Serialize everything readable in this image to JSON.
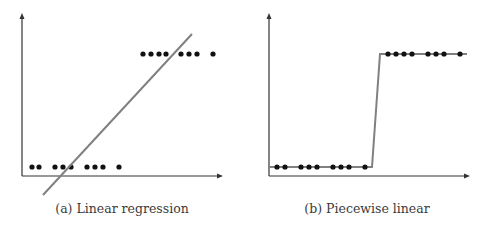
{
  "colors": {
    "axis": "#333333",
    "dot": "#111111",
    "fit_line": "#808080",
    "caption": "#3a3a3a"
  },
  "chart_data": [
    {
      "type": "scatter",
      "title": "(a) Linear regression",
      "caption": "(a) Linear regression",
      "xlabel": "",
      "ylabel": "",
      "grid": false,
      "ticks": false,
      "points": {
        "low": {
          "y": 0,
          "x": [
            1,
            2,
            4,
            5,
            6,
            8,
            9,
            10,
            12
          ]
        },
        "high": {
          "y": 1,
          "x": [
            15,
            16,
            17,
            18,
            20,
            21,
            22,
            24
          ]
        }
      },
      "fit": {
        "kind": "linear",
        "from": [
          2.6,
          -0.25
        ],
        "to": [
          21.3,
          1.2
        ]
      },
      "pixel_geometry": {
        "origin": [
          22,
          176
        ],
        "x_axis_end": 222,
        "y_axis_top": 14,
        "low_y": 167,
        "high_y": 54,
        "low_x": [
          32,
          39,
          55,
          63,
          71,
          87,
          95,
          103,
          119
        ],
        "high_x": [
          143,
          151,
          159,
          166,
          181,
          189,
          197,
          213
        ],
        "line": [
          [
            43,
            195
          ],
          [
            192,
            34
          ]
        ]
      }
    },
    {
      "type": "line",
      "title": "(b) Piecewise linear",
      "caption": "(b) Piecewise linear",
      "xlabel": "",
      "ylabel": "",
      "grid": false,
      "ticks": false,
      "points": {
        "low": {
          "y": 0,
          "x": [
            1,
            2,
            4,
            5,
            6,
            8,
            9,
            10,
            12
          ]
        },
        "high": {
          "y": 1,
          "x": [
            15,
            16,
            17,
            18,
            20,
            21,
            22,
            24
          ]
        }
      },
      "fit": {
        "kind": "piecewise",
        "segments": [
          [
            [
              0,
              0
            ],
            [
              13,
              0
            ]
          ],
          [
            [
              13,
              0
            ],
            [
              14,
              1
            ]
          ],
          [
            [
              14,
              1
            ],
            [
              25,
              1
            ]
          ]
        ]
      },
      "pixel_geometry": {
        "origin": [
          269,
          176
        ],
        "x_axis_end": 469,
        "y_axis_top": 14,
        "low_y": 167,
        "high_y": 54,
        "low_x": [
          277,
          285,
          301,
          309,
          317,
          333,
          341,
          349,
          365
        ],
        "high_x": [
          388,
          396,
          404,
          412,
          428,
          436,
          444,
          460
        ],
        "line": [
          [
            269,
            167
          ],
          [
            372,
            167
          ],
          [
            380,
            54
          ],
          [
            467,
            54
          ]
        ]
      }
    }
  ]
}
